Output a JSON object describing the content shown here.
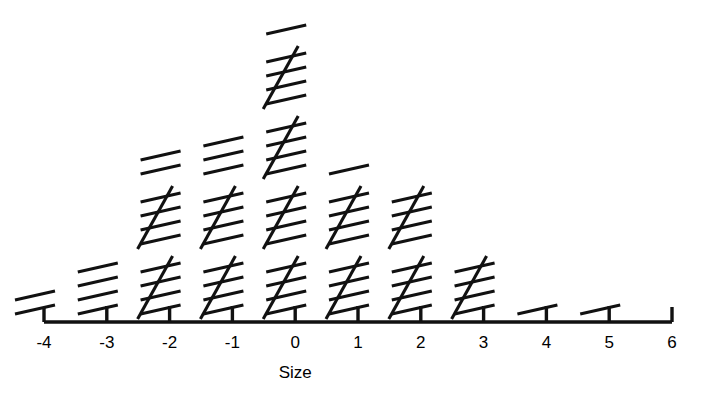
{
  "chart_data": {
    "type": "bar",
    "render_style": "tally-mark-dot-plot",
    "title": "",
    "subtitle": "",
    "xlabel": "Size",
    "ylabel": "",
    "categories": [
      "-4",
      "-3",
      "-2",
      "-1",
      "0",
      "1",
      "2",
      "3",
      "4",
      "5",
      "6"
    ],
    "values": [
      2,
      4,
      12,
      13,
      21,
      11,
      10,
      5,
      1,
      1,
      0
    ],
    "x": [
      -4,
      -3,
      -2,
      -1,
      0,
      1,
      2,
      3,
      4,
      5,
      6
    ],
    "xlim": [
      -4,
      6
    ],
    "ylim": [
      0,
      21
    ],
    "grid": false,
    "legend": null,
    "axis_ticks_visible": true,
    "yaxis_visible": false,
    "tally_group_size": 5,
    "groups_per_column": [
      {
        "category": "-4",
        "full_groups": 0,
        "remainder": 2,
        "total": 2
      },
      {
        "category": "-3",
        "full_groups": 0,
        "remainder": 4,
        "total": 4
      },
      {
        "category": "-2",
        "full_groups": 2,
        "remainder": 2,
        "total": 12
      },
      {
        "category": "-1",
        "full_groups": 2,
        "remainder": 3,
        "total": 13
      },
      {
        "category": "0",
        "full_groups": 4,
        "remainder": 1,
        "total": 21
      },
      {
        "category": "1",
        "full_groups": 2,
        "remainder": 1,
        "total": 11
      },
      {
        "category": "2",
        "full_groups": 2,
        "remainder": 0,
        "total": 10
      },
      {
        "category": "3",
        "full_groups": 1,
        "remainder": 0,
        "total": 5
      },
      {
        "category": "4",
        "full_groups": 0,
        "remainder": 1,
        "total": 1
      },
      {
        "category": "5",
        "full_groups": 0,
        "remainder": 1,
        "total": 1
      },
      {
        "category": "6",
        "full_groups": 0,
        "remainder": 0,
        "total": 0
      }
    ]
  },
  "axis": {
    "title": "Size",
    "tick_labels": [
      "-4",
      "-3",
      "-2",
      "-1",
      "0",
      "1",
      "2",
      "3",
      "4",
      "5",
      "6"
    ]
  },
  "colors": {
    "ink": "#111111",
    "background": "#ffffff"
  }
}
